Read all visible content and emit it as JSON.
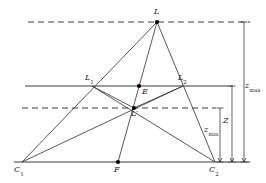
{
  "figure": {
    "type": "geometry-diagram",
    "colors": {
      "stroke": "#3a3a3a",
      "point": "#000000",
      "label": "#1a1a1a",
      "background": "#ffffff"
    }
  },
  "points": {
    "L": {
      "label": "L",
      "sub": "",
      "x": 157,
      "y": 22,
      "lx": 154,
      "ly": 8,
      "dot": true
    },
    "L1": {
      "label": "L",
      "sub": "1",
      "x": 92,
      "y": 86,
      "lx": 85,
      "ly": 74,
      "dot": false
    },
    "L2": {
      "label": "L",
      "sub": "2",
      "x": 183,
      "y": 86,
      "lx": 178,
      "ly": 74,
      "dot": false
    },
    "E": {
      "label": "E",
      "sub": "",
      "x": 139,
      "y": 86,
      "lx": 142,
      "ly": 88,
      "dot": true
    },
    "Lp": {
      "label": "L′",
      "sub": "",
      "x": 134,
      "y": 108,
      "lx": 131,
      "ly": 110,
      "dot": true
    },
    "C1": {
      "label": "C",
      "sub": "1",
      "x": 22,
      "y": 162,
      "lx": 14,
      "ly": 166,
      "dot": false
    },
    "C2": {
      "label": "C",
      "sub": "2",
      "x": 215,
      "y": 162,
      "lx": 209,
      "ly": 166,
      "dot": false
    },
    "F": {
      "label": "F",
      "sub": "",
      "x": 118,
      "y": 162,
      "lx": 114,
      "ly": 166,
      "dot": true
    }
  },
  "horizontal_lines": [
    {
      "name": "z-max-plane",
      "style": "dashed",
      "y": 22,
      "x1": 28,
      "x2": 250
    },
    {
      "name": "z-plane",
      "style": "solid",
      "y": 86,
      "x1": 25,
      "x2": 233
    },
    {
      "name": "z-min-plane",
      "style": "dashed",
      "y": 108,
      "x1": 22,
      "x2": 216
    },
    {
      "name": "baseline",
      "style": "solid",
      "y": 162,
      "x1": 14,
      "x2": 250
    }
  ],
  "segments": [
    {
      "name": "L-to-C1",
      "from": "L",
      "to": "C1"
    },
    {
      "name": "L-to-C2",
      "from": "L",
      "to": "C2"
    },
    {
      "name": "L-to-F",
      "from": "L",
      "to": "F"
    },
    {
      "name": "C1-to-L2",
      "from": "C1",
      "to": "L2"
    },
    {
      "name": "C2-to-L1",
      "from": "C2",
      "to": "L1"
    },
    {
      "name": "L1-to-Lp",
      "from": "L1",
      "to": "Lp"
    },
    {
      "name": "L2-to-Lp",
      "from": "L2",
      "to": "Lp"
    }
  ],
  "measures": [
    {
      "name": "z-min",
      "label": "z",
      "sub": "min",
      "x": 220,
      "y_top": 108,
      "y_bottom": 162,
      "lx": 204,
      "ly": 126
    },
    {
      "name": "Z",
      "label": "Z",
      "sub": "",
      "x": 232,
      "y_top": 86,
      "y_bottom": 162,
      "lx": 223,
      "ly": 117
    },
    {
      "name": "z-max",
      "label": "z",
      "sub": "max",
      "x": 244,
      "y_top": 22,
      "y_bottom": 162,
      "lx": 245,
      "ly": 82
    }
  ],
  "labels": {
    "L": "L",
    "L1": "L",
    "L1sub": "1",
    "L2": "L",
    "L2sub": "2",
    "E": "E",
    "Lprime": "L′",
    "C1": "C",
    "C1sub": "1",
    "C2": "C",
    "C2sub": "2",
    "F": "F",
    "zmin": "z",
    "zminsub": "min",
    "Z": "Z",
    "zmax": "z",
    "zmaxsub": "max"
  }
}
